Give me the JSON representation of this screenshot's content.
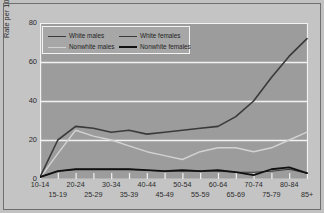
{
  "chart_data": {
    "type": "line",
    "title": "",
    "xlabel": "",
    "ylabel": "Rate per 100,000 Population",
    "ylim": [
      0,
      80
    ],
    "yticks": [
      0,
      20,
      40,
      60,
      80
    ],
    "grid": true,
    "legend_position": "top-left",
    "categories": [
      "10-14",
      "15-19",
      "20-24",
      "25-29",
      "30-34",
      "35-39",
      "40-44",
      "45-49",
      "50-54",
      "55-59",
      "60-64",
      "65-69",
      "70-74",
      "75-79",
      "80-84",
      "85+"
    ],
    "series": [
      {
        "name": "White males",
        "color": "#3a3a3a",
        "width": 1.6,
        "values": [
          1,
          20,
          27,
          26,
          24,
          25,
          23,
          24,
          25,
          26,
          27,
          32,
          40,
          52,
          63,
          72
        ]
      },
      {
        "name": "White females",
        "color": "#3a3a3a",
        "width": 1.1,
        "values": [
          1,
          4,
          5,
          5,
          5,
          5,
          4.5,
          4,
          4,
          4,
          4,
          3.5,
          3.5,
          4,
          5,
          3
        ]
      },
      {
        "name": "Nonwhite males",
        "color": "#d2d2d2",
        "width": 1.4,
        "values": [
          0.5,
          13,
          25,
          22,
          20,
          17,
          14,
          12,
          10,
          14,
          16,
          16,
          14,
          16,
          20,
          24
        ]
      },
      {
        "name": "Nonwhite females",
        "color": "#111111",
        "width": 1.8,
        "values": [
          1,
          4,
          5,
          5,
          5,
          5,
          4.5,
          4,
          4.5,
          4,
          4.5,
          3.5,
          2,
          5,
          6,
          3
        ]
      }
    ]
  },
  "legend": {
    "entries": [
      {
        "label": "White males",
        "color": "#3a3a3a",
        "width": 1.8
      },
      {
        "label": "White females",
        "color": "#3a3a3a",
        "width": 1.0
      },
      {
        "label": "Nonwhite males",
        "color": "#d2d2d2",
        "width": 1.4
      },
      {
        "label": "Nonwhite females",
        "color": "#111111",
        "width": 2.0
      }
    ]
  },
  "colors": {
    "figure_background": "#c4c4c4",
    "plot_background": "#9c9c9c",
    "gridline": "#f2f2f2",
    "axis_text": "#2b2b2b",
    "frame": "#6f6f6f"
  }
}
